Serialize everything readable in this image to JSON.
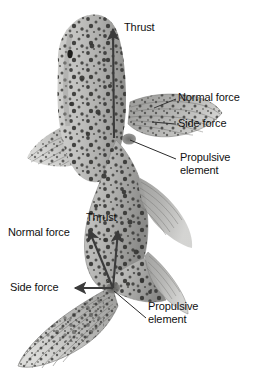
{
  "figure": {
    "background_color": "#ffffff",
    "body_color": "#b9b9b7",
    "body_shadow_color": "#8e8e8c",
    "spot_color": "#3a3a38",
    "fin_color": "#a8a8a6",
    "fin_ray_color": "#6e6e6c",
    "arrow_color": "#3b3b3b",
    "leader_color": "#2b2b2b",
    "text_color": "#111111"
  },
  "labels": {
    "upper": {
      "thrust": "Thrust",
      "normal_force": "Normal force",
      "side_force": "Side force",
      "propulsive_element_line1": "Propulsive",
      "propulsive_element_line2": "element"
    },
    "lower": {
      "thrust": "Thrust",
      "normal_force": "Normal force",
      "side_force": "Side force",
      "propulsive_element_line1": "Propulsive",
      "propulsive_element_line2": "element"
    }
  },
  "annotations": [
    {
      "group": "pectoral-fin",
      "origin_px": [
        129,
        140
      ],
      "vectors": [
        {
          "name": "Thrust",
          "kind": "arrow",
          "from_px": [
            115,
            138
          ],
          "to_px": [
            113,
            28
          ]
        },
        {
          "name": "Normal force",
          "kind": "leader",
          "from_px": [
            176,
            99
          ],
          "to_px": [
            160,
            107
          ]
        },
        {
          "name": "Side force",
          "kind": "leader",
          "from_px": [
            176,
            125
          ],
          "to_px": [
            158,
            122
          ]
        },
        {
          "name": "Propulsive element",
          "kind": "leader",
          "from_px": [
            172,
            159
          ],
          "to_px": [
            129,
            140
          ]
        }
      ]
    },
    {
      "group": "caudal-fin",
      "origin_px": [
        113,
        288
      ],
      "vectors": [
        {
          "name": "Thrust",
          "kind": "arrow",
          "from_px": [
            113,
            288
          ],
          "to_px": [
            118,
            232
          ]
        },
        {
          "name": "Normal force",
          "kind": "arrow",
          "from_px": [
            113,
            288
          ],
          "to_px": [
            90,
            230
          ]
        },
        {
          "name": "Side force",
          "kind": "arrow",
          "from_px": [
            113,
            288
          ],
          "to_px": [
            76,
            288
          ]
        },
        {
          "name": "Propulsive element",
          "kind": "leader",
          "from_px": [
            145,
            318
          ],
          "to_px": [
            113,
            290
          ]
        }
      ]
    }
  ],
  "label_positions": {
    "upper_thrust": [
      124,
      22
    ],
    "upper_normal_force": [
      178,
      92
    ],
    "upper_side_force": [
      178,
      118
    ],
    "upper_propulsive": [
      180,
      152
    ],
    "lower_thrust": [
      86,
      212
    ],
    "lower_normal_force": [
      8,
      227
    ],
    "lower_side_force": [
      10,
      282
    ],
    "lower_propulsive": [
      148,
      301
    ]
  }
}
